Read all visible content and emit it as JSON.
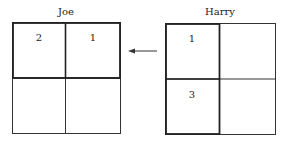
{
  "joe": {
    "title": "Joe",
    "cells": [
      "2",
      "1",
      "",
      ""
    ]
  },
  "harry": {
    "title": "Harry",
    "cells": [
      "1",
      "",
      "3",
      ""
    ]
  },
  "arrow": {
    "direction": "left",
    "from": "harry",
    "to": "joe"
  }
}
